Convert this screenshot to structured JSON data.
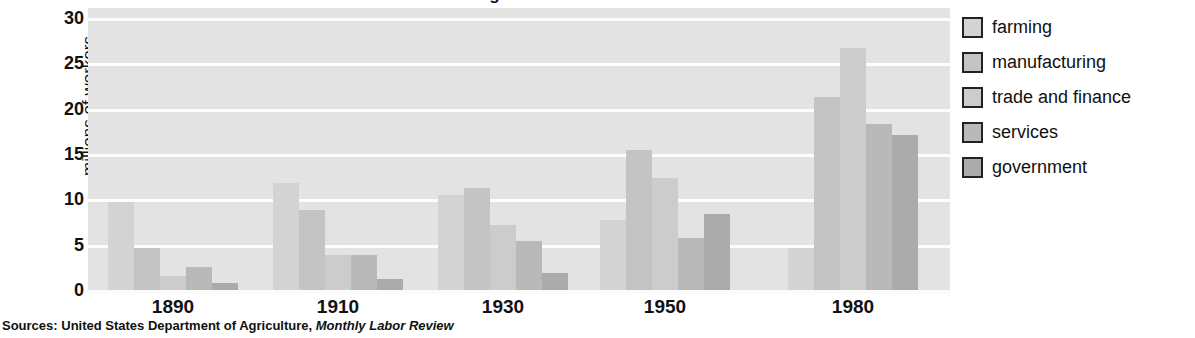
{
  "title_cropped": "Changes in the American Work Force",
  "chart_data": {
    "type": "bar",
    "title": "",
    "xlabel": "",
    "ylabel": "millions of workers",
    "ylim": [
      0,
      30
    ],
    "yticks": [
      0,
      5,
      10,
      15,
      20,
      25,
      30
    ],
    "grid": true,
    "legend_position": "right",
    "categories": [
      "1890",
      "1910",
      "1930",
      "1950",
      "1980"
    ],
    "series": [
      {
        "name": "farming",
        "color": "#d3d3d3",
        "values": [
          9.7,
          11.8,
          10.5,
          7.7,
          4.6
        ]
      },
      {
        "name": "manufacturing",
        "color": "#c4c4c4",
        "values": [
          4.6,
          8.8,
          11.3,
          15.4,
          21.3
        ]
      },
      {
        "name": "trade and finance",
        "color": "#cccccc",
        "values": [
          1.6,
          3.9,
          7.2,
          12.4,
          26.7
        ]
      },
      {
        "name": "services",
        "color": "#b9b9b9",
        "values": [
          2.5,
          3.9,
          5.4,
          5.7,
          18.3
        ]
      },
      {
        "name": "government",
        "color": "#ababab",
        "values": [
          0.8,
          1.2,
          1.9,
          8.4,
          17.1
        ]
      }
    ]
  },
  "source": {
    "prefix": "Sources: United States Department of Agriculture, ",
    "italic": "Monthly Labor Review"
  },
  "colors": {
    "plot_background": "#e3e3e3",
    "gridline": "#fdfdfd",
    "text": "#111111",
    "swatch_border": "#222222"
  }
}
